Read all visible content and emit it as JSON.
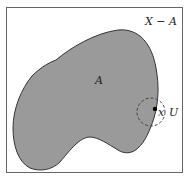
{
  "diagram": {
    "space_label": "X − A",
    "set_label": "A",
    "point_label": "x",
    "neighborhood_label": "U",
    "colors": {
      "frame": "#666666",
      "region_fill": "#9a9a9a",
      "region_stroke": "#333333",
      "neighborhood_stroke": "#444444",
      "point": "#000000",
      "background": "#ffffff"
    }
  }
}
